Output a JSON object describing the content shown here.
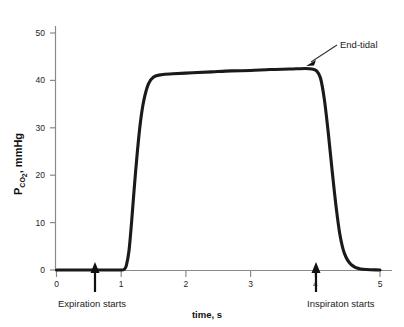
{
  "chart_data": {
    "type": "line",
    "title": "",
    "xlabel": "time, s",
    "ylabel": "P_CO2, mmHg",
    "ylabel_main": "P",
    "ylabel_sub": "CO",
    "ylabel_sub2": "2",
    "ylabel_unit": ", mmHg",
    "xlim": [
      0,
      5
    ],
    "ylim": [
      0,
      53
    ],
    "xticks": [
      0,
      1,
      2,
      3,
      4,
      5
    ],
    "xticklabels": [
      "0",
      "1",
      "2",
      "3",
      "4",
      "5"
    ],
    "yticks": [
      0,
      10,
      20,
      30,
      40,
      50
    ],
    "yticklabels": [
      "0",
      "10",
      "20",
      "30",
      "40",
      "50"
    ],
    "grid": false,
    "legend": false,
    "series": [
      {
        "name": "capnogram",
        "x": [
          0.0,
          0.4,
          0.8,
          1.0,
          1.05,
          1.08,
          1.12,
          1.16,
          1.2,
          1.25,
          1.3,
          1.35,
          1.42,
          1.5,
          1.62,
          1.8,
          2.1,
          2.4,
          2.7,
          3.0,
          3.3,
          3.6,
          3.85,
          3.95,
          4.02,
          4.08,
          4.14,
          4.2,
          4.26,
          4.32,
          4.38,
          4.45,
          4.55,
          4.7,
          5.0
        ],
        "y": [
          0.0,
          0.0,
          0.0,
          0.0,
          0.2,
          1.0,
          4.0,
          10.0,
          17.0,
          25.0,
          31.5,
          35.8,
          39.2,
          40.7,
          41.2,
          41.4,
          41.6,
          41.8,
          42.0,
          42.1,
          42.3,
          42.4,
          42.5,
          42.4,
          42.0,
          40.5,
          36.0,
          29.0,
          21.0,
          13.5,
          7.5,
          3.5,
          1.2,
          0.2,
          0.0
        ]
      }
    ],
    "annotations": [
      {
        "text": "End-tidal",
        "x": 3.95,
        "y": 42.5,
        "label_x": 4.3,
        "label_y": 48.5
      },
      {
        "text": "Expiration starts",
        "x": 0.65,
        "y": 0,
        "marker": "up-arrow"
      },
      {
        "text": "Inspiraton starts",
        "x": 3.9,
        "y": 0,
        "marker": "up-arrow"
      }
    ]
  },
  "axes": {
    "x_title": "time, s",
    "y_title_prefix": "P",
    "y_title_sub": "CO",
    "y_title_sub_num": "2",
    "y_title_suffix": ", mmHg"
  },
  "annotation_labels": {
    "end_tidal": "End-tidal",
    "expiration": "Expiration starts",
    "inspiration": "Inspiraton starts"
  },
  "tick_labels": {
    "y": [
      "0",
      "10",
      "20",
      "30",
      "40",
      "50"
    ],
    "x": [
      "0",
      "1",
      "2",
      "3",
      "4",
      "5"
    ]
  },
  "colors": {
    "curve": "#1a1a1a",
    "axis": "#8a8a8a",
    "text": "#1d1d1d",
    "background": "#ffffff"
  }
}
